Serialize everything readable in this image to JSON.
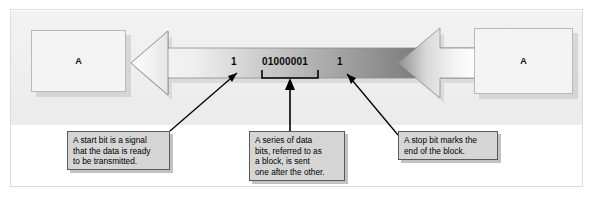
{
  "diagram": {
    "nodes": [
      {
        "name": "node-left",
        "label": "A"
      },
      {
        "name": "node-right",
        "label": "A"
      }
    ],
    "bits": {
      "start_bit": "1",
      "data_bits": "01000001",
      "stop_bit": "1"
    },
    "captions": [
      {
        "name": "caption-start",
        "text": "A start bit is a signal\nthat the data is ready\nto be transmitted."
      },
      {
        "name": "caption-data",
        "text": "A series of data\nbits, referred to as\na block, is sent\none after the other."
      },
      {
        "name": "caption-stop",
        "text": "A stop bit marks the\nend of the block."
      }
    ],
    "colors": {
      "panel_background": "#eeeeee",
      "caption_fill": "#d5d5d5",
      "caption_border": "#595959",
      "node_fill": "#f4f4f4",
      "node_border": "#b9b9b9",
      "arrow_light": "#f3f3f3",
      "arrow_dark": "#6e6e6e",
      "pointer_line": "#000000",
      "text": "#000000"
    }
  }
}
